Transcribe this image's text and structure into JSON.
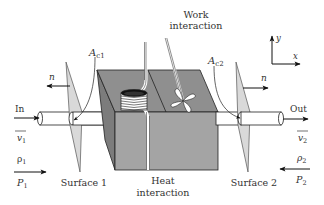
{
  "diagram": {
    "type": "control-volume-schematic",
    "colors": {
      "box_top": "#8f8f8f",
      "box_front": "#a4a4a4",
      "box_left": "#7c7c7c",
      "surface_fill": "#d9d9d9",
      "line": "#222222",
      "pipe_fill": "#ffffff",
      "text": "#333333"
    },
    "labels": {
      "work": "Work",
      "work2": "interaction",
      "heat": "Heat",
      "heat2": "interaction",
      "ac1": "A",
      "ac1_sub": "c1",
      "ac2": "A",
      "ac2_sub": "c2",
      "n_left": "n",
      "n_right": "n",
      "in": "In",
      "out": "Out",
      "v1": "v",
      "v1_sub": "1",
      "v2": "v",
      "v2_sub": "2",
      "rho1": "ρ",
      "rho1_sub": "1",
      "rho2": "ρ",
      "rho2_sub": "2",
      "p1": "P",
      "p1_sub": "1",
      "p2": "P",
      "p2_sub": "2",
      "surface1": "Surface 1",
      "surface2": "Surface 2",
      "axis_y": "y",
      "axis_x": "x"
    }
  }
}
